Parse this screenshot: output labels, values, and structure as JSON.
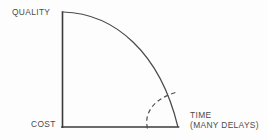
{
  "diagram": {
    "type": "line-arc-diagram",
    "background_color": "#fdfdfd",
    "line_color": "#3a3a3a",
    "arc_color": "#4a4a4a",
    "dashed_arc_color": "#4f4f4f",
    "text_color": "#4b4b4b",
    "axes": {
      "vertical": {
        "name": "quality-axis",
        "label_top": "QUALITY",
        "label_bottom": "COST",
        "x": 62,
        "y_top": 12,
        "y_bottom": 127
      },
      "horizontal": {
        "name": "time-axis",
        "label_line1": "TIME",
        "label_line2": "(MANY DELAYS)",
        "y": 127,
        "x_left": 62,
        "x_right": 178
      }
    },
    "curves": [
      {
        "name": "main-arc",
        "style": "solid",
        "center": [
          62,
          127
        ],
        "radius": 115,
        "start": [
          62,
          12
        ],
        "end": [
          178,
          127
        ]
      },
      {
        "name": "inner-dashed-arc",
        "style": "dashed",
        "start": [
          148,
          128
        ],
        "end": [
          177,
          92
        ],
        "dash_length": 4.5,
        "gap_length": 3.2
      }
    ]
  },
  "labels": {
    "quality": "QUALITY",
    "cost": "COST",
    "time": "TIME",
    "time_sub": "(MANY DELAYS)"
  }
}
